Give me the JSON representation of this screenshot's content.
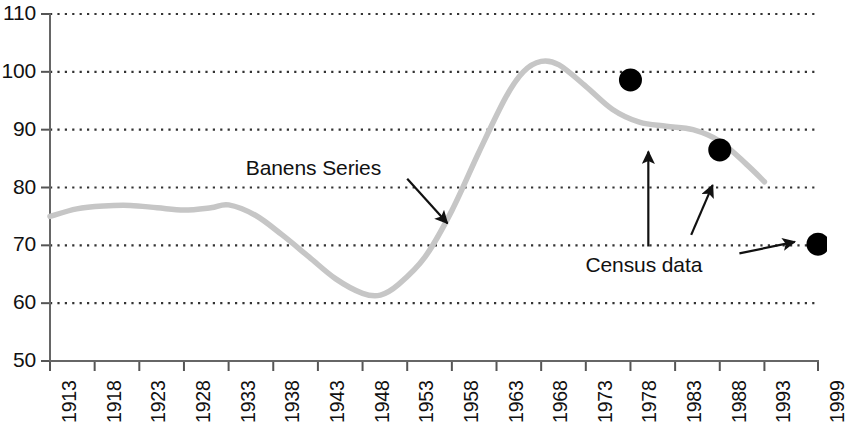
{
  "chart_data": {
    "type": "line",
    "title": "",
    "xlabel": "",
    "ylabel": "",
    "xlim": [
      1913,
      1999
    ],
    "ylim": [
      50,
      110
    ],
    "grid": true,
    "grid_style": "dotted-horizontal",
    "legend": "none",
    "y_ticks": [
      110,
      100,
      90,
      80,
      70,
      60,
      50
    ],
    "x_ticks": [
      1913,
      1918,
      1923,
      1928,
      1933,
      1938,
      1943,
      1948,
      1953,
      1958,
      1963,
      1968,
      1973,
      1978,
      1983,
      1988,
      1993,
      1999
    ],
    "series": [
      {
        "name": "Banens Series",
        "style": "smooth-line",
        "color": "#c6c6c6",
        "x": [
          1913,
          1916,
          1919,
          1922,
          1925,
          1928,
          1931,
          1933,
          1936,
          1939,
          1942,
          1945,
          1948,
          1950,
          1952,
          1955,
          1958,
          1961,
          1964,
          1966,
          1968,
          1970,
          1973,
          1976,
          1979,
          1982,
          1985,
          1988,
          1991,
          1993
        ],
        "values": [
          75.0,
          76.3,
          76.8,
          76.9,
          76.5,
          76.1,
          76.5,
          77.0,
          75.2,
          71.8,
          68.0,
          64.2,
          61.7,
          61.4,
          63.2,
          68.0,
          76.0,
          86.0,
          95.5,
          100.0,
          101.8,
          101.2,
          97.5,
          93.5,
          91.3,
          90.6,
          90.0,
          88.0,
          84.0,
          81.0
        ]
      },
      {
        "name": "Census data",
        "style": "markers",
        "color": "#000000",
        "points": [
          {
            "x": 1978,
            "y": 98.6
          },
          {
            "x": 1988,
            "y": 86.5
          },
          {
            "x": 1999,
            "y": 70.2
          }
        ]
      }
    ],
    "annotations": [
      {
        "text": "Banens Series",
        "label_x": 1942.5,
        "label_y": 83.2,
        "arrow_from": {
          "x": 1953.0,
          "y": 81.5
        },
        "arrow_to": {
          "x": 1957.5,
          "y": 73.8
        }
      },
      {
        "text": "Census data",
        "label_x": 1979.5,
        "label_y": 66.5,
        "arrow_from": {
          "x": 1990.2,
          "y": 68.6
        },
        "arrow_to": {
          "x": 1996.4,
          "y": 70.6
        }
      },
      {
        "text": "",
        "arrow_from": {
          "x": 1980.0,
          "y": 69.8
        },
        "arrow_to": {
          "x": 1980.0,
          "y": 86.2
        }
      },
      {
        "text": "",
        "arrow_from": {
          "x": 1984.8,
          "y": 71.8
        },
        "arrow_to": {
          "x": 1987.2,
          "y": 80.4
        }
      }
    ]
  },
  "axis": {
    "y_tick_labels": [
      "110",
      "100",
      "90",
      "80",
      "70",
      "60",
      "50"
    ],
    "x_tick_labels": [
      "1913",
      "1918",
      "1923",
      "1928",
      "1933",
      "1938",
      "1943",
      "1948",
      "1953",
      "1958",
      "1963",
      "1968",
      "1973",
      "1978",
      "1983",
      "1988",
      "1993",
      "1999"
    ]
  },
  "annotations_text": {
    "series_label": "Banens Series",
    "census_label": "Census data"
  },
  "colors": {
    "line": "#c6c6c6",
    "marker": "#000000",
    "axis": "#555555",
    "grid": "#333333",
    "text": "#111111"
  }
}
